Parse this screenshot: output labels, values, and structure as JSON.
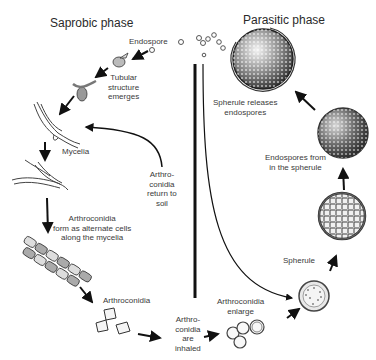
{
  "diagram": {
    "phases": {
      "saprobic": "Saprobic phase",
      "parasitic": "Parasitic phase"
    },
    "labels": {
      "endospore": "Endospore",
      "tubular_1": "Tubular",
      "tubular_2": "structure",
      "tubular_3": "emerges",
      "mycelia": "Mycelia",
      "return_1": "Arthro-",
      "return_2": "conidia",
      "return_3": "return to",
      "return_4": "soil",
      "form_1": "Arthroconidia",
      "form_2": "form as alternate cells",
      "form_3": "along the mycelia",
      "arthroconidia": "Arthroconidia",
      "inhaled_1": "Arthro-",
      "inhaled_2": "conidia",
      "inhaled_3": "are",
      "inhaled_4": "inhaled",
      "enlarge_1": "Arthroconidia",
      "enlarge_2": "enlarge",
      "spherule": "Spherule",
      "endospores_from_1": "Endospores from",
      "endospores_from_2": "in the spherule",
      "releases_1": "Spherule releases",
      "releases_2": "endospores"
    },
    "colors": {
      "ink": "#1a1a1a",
      "text": "#3a3a3a",
      "background": "#ffffff"
    }
  }
}
